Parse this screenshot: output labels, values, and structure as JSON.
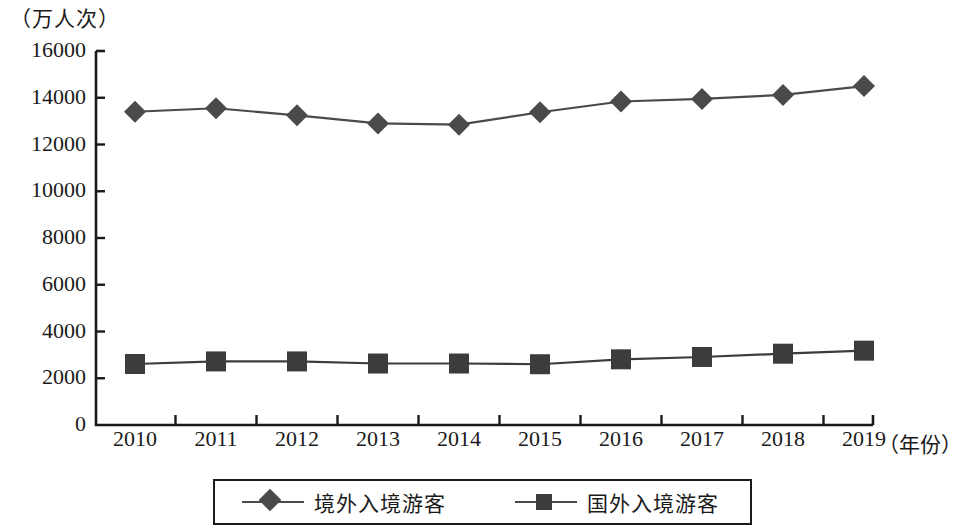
{
  "chart_data": {
    "type": "line",
    "title": "",
    "subtitle": "",
    "xlabel": "（年份）",
    "ylabel": "（万人次）",
    "categories": [
      "2010",
      "2011",
      "2012",
      "2013",
      "2014",
      "2015",
      "2016",
      "2017",
      "2018",
      "2019"
    ],
    "x": [
      2010,
      2011,
      2012,
      2013,
      2014,
      2015,
      2016,
      2017,
      2018,
      2019
    ],
    "ylim": [
      0,
      16000
    ],
    "yticks": [
      "0",
      "2000",
      "4000",
      "6000",
      "8000",
      "10000",
      "12000",
      "14000",
      "16000"
    ],
    "ytick_values": [
      0,
      2000,
      4000,
      6000,
      8000,
      10000,
      12000,
      14000,
      16000
    ],
    "grid": false,
    "legend_position": "bottom",
    "series": [
      {
        "name": "境外入境游客",
        "marker": "diamond",
        "color": "#4a4a4a",
        "values": [
          13400,
          13550,
          13250,
          12900,
          12850,
          13380,
          13840,
          13950,
          14120,
          14500
        ]
      },
      {
        "name": "国外入境游客",
        "marker": "square",
        "color": "#3c3c3c",
        "values": [
          2610,
          2720,
          2720,
          2630,
          2630,
          2600,
          2810,
          2910,
          3050,
          3180
        ]
      }
    ]
  },
  "colors": {
    "axis": "#1a1a1a",
    "series1": "#4a4a4a",
    "series2": "#3c3c3c",
    "background": "#ffffff"
  }
}
